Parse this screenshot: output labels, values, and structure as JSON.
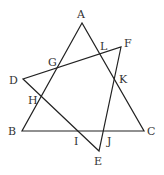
{
  "diagram": {
    "title": "",
    "points": {
      "A": {
        "label": "A",
        "x": 82,
        "y": 23,
        "lx": 77,
        "ly": 18
      },
      "B": {
        "label": "B",
        "x": 22,
        "y": 131,
        "lx": 8,
        "ly": 135
      },
      "C": {
        "label": "C",
        "x": 144,
        "y": 131,
        "lx": 147,
        "ly": 135
      },
      "D": {
        "label": "D",
        "x": 23,
        "y": 79,
        "lx": 9,
        "ly": 84
      },
      "E": {
        "label": "E",
        "x": 99,
        "y": 151,
        "lx": 94,
        "ly": 165
      },
      "F": {
        "label": "F",
        "x": 121,
        "y": 47,
        "lx": 124,
        "ly": 47
      },
      "G": {
        "label": "G",
        "x": 57,
        "y": 68,
        "lx": 48,
        "ly": 66
      },
      "H": {
        "label": "H",
        "x": 40,
        "y": 97,
        "lx": 28,
        "ly": 104
      },
      "I": {
        "label": "I",
        "x": 78,
        "y": 131,
        "lx": 74,
        "ly": 145
      },
      "J": {
        "label": "J",
        "x": 105,
        "y": 131,
        "lx": 107,
        "ly": 145
      },
      "K": {
        "label": "K",
        "x": 115,
        "y": 79,
        "lx": 119,
        "ly": 83
      },
      "L": {
        "label": "L",
        "x": 100,
        "y": 53,
        "lx": 100,
        "ly": 50
      }
    },
    "triangles": [
      {
        "name": "ABC",
        "vertices": [
          "A",
          "B",
          "C"
        ]
      },
      {
        "name": "DEF",
        "vertices": [
          "D",
          "E",
          "F"
        ]
      }
    ]
  }
}
